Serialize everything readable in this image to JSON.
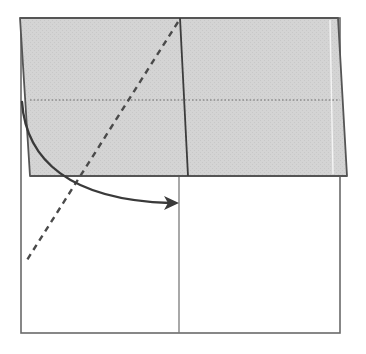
{
  "diagram": {
    "type": "origami-fold-step",
    "colors": {
      "background": "#ffffff",
      "paper_white": "#ffffff",
      "paper_shaded": "#d6d6d6",
      "outline": "#5a5a5a",
      "crease": "#3c3c3c",
      "valley_line": "#555555",
      "dotted_line": "#8a8a8a",
      "arrow": "#3a3a3a",
      "highlight": "#f2f2f2"
    },
    "base_square": {
      "x1": 21,
      "y1": 18,
      "x2": 340,
      "y2": 333
    },
    "lower_center_crease": {
      "x": 179,
      "y1": 176,
      "y2": 333
    },
    "shaded_flap": {
      "points": [
        [
          20,
          18
        ],
        [
          338,
          18
        ],
        [
          347,
          176
        ],
        [
          30,
          176
        ]
      ]
    },
    "flap_crease": {
      "x1": 180,
      "y1": 18,
      "x2": 188,
      "y2": 176
    },
    "flap_highlight": {
      "x1": 330,
      "y1": 20,
      "x2": 333,
      "y2": 174
    },
    "dotted_hidden_line": {
      "x1": 30,
      "y1": 100,
      "x2": 340,
      "y2": 100
    },
    "valley_fold_line": {
      "x1": 178,
      "y1": 22,
      "x2": 27,
      "y2": 260
    },
    "fold_arrow": {
      "path": "M 22 102 C 26 160, 70 200, 170 203",
      "head_tip": [
        179,
        203
      ]
    }
  }
}
